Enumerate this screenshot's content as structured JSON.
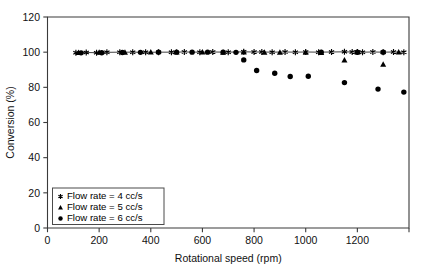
{
  "chart_data": {
    "type": "scatter",
    "title": "",
    "xlabel": "Rotational speed (rpm)",
    "ylabel": "Conversion (%)",
    "xlim": [
      0,
      1400
    ],
    "ylim": [
      0,
      120
    ],
    "xticks": [
      0,
      200,
      400,
      600,
      800,
      1000,
      1200
    ],
    "xticks_minor": [
      1400
    ],
    "yticks": [
      0,
      20,
      40,
      60,
      80,
      100,
      120
    ],
    "grid": false,
    "legend_position": "lower left",
    "series": [
      {
        "name": "Flow rate  =  4 cc/s",
        "marker": "star",
        "color": "#000000",
        "points": [
          [
            110,
            99.6
          ],
          [
            150,
            99.8
          ],
          [
            190,
            99.7
          ],
          [
            230,
            99.9
          ],
          [
            280,
            100.0
          ],
          [
            330,
            100.0
          ],
          [
            380,
            99.9
          ],
          [
            430,
            100.0
          ],
          [
            480,
            100.0
          ],
          [
            530,
            100.1
          ],
          [
            590,
            100.0
          ],
          [
            640,
            100.1
          ],
          [
            700,
            100.0
          ],
          [
            760,
            100.2
          ],
          [
            800,
            100.1
          ],
          [
            830,
            100.1
          ],
          [
            870,
            100.0
          ],
          [
            920,
            100.1
          ],
          [
            960,
            100.0
          ],
          [
            1000,
            100.1
          ],
          [
            1050,
            100.0
          ],
          [
            1100,
            100.1
          ],
          [
            1150,
            100.2
          ],
          [
            1180,
            100.1
          ],
          [
            1200,
            100.1
          ],
          [
            1220,
            100.0
          ],
          [
            1260,
            100.1
          ],
          [
            1300,
            100.0
          ],
          [
            1340,
            100.1
          ],
          [
            1380,
            100.0
          ]
        ]
      },
      {
        "name": "Flow rate  =  5 cc/s",
        "marker": "triangle",
        "color": "#000000",
        "points": [
          [
            120,
            99.7
          ],
          [
            200,
            99.8
          ],
          [
            300,
            99.9
          ],
          [
            400,
            100.0
          ],
          [
            500,
            100.0
          ],
          [
            600,
            100.0
          ],
          [
            680,
            99.9
          ],
          [
            760,
            100.0
          ],
          [
            840,
            99.9
          ],
          [
            900,
            99.8
          ],
          [
            1000,
            99.9
          ],
          [
            1060,
            99.7
          ],
          [
            1150,
            95.5
          ],
          [
            1200,
            100.0
          ],
          [
            1300,
            93.0
          ],
          [
            1360,
            100.0
          ]
        ]
      },
      {
        "name": "Flow rate  =  6 cc/s",
        "marker": "circle",
        "color": "#000000",
        "points": [
          [
            130,
            99.6
          ],
          [
            210,
            99.7
          ],
          [
            290,
            99.8
          ],
          [
            360,
            99.9
          ],
          [
            430,
            100.0
          ],
          [
            500,
            100.0
          ],
          [
            560,
            100.0
          ],
          [
            620,
            100.0
          ],
          [
            680,
            100.0
          ],
          [
            730,
            99.9
          ],
          [
            760,
            95.6
          ],
          [
            810,
            89.6
          ],
          [
            880,
            88.0
          ],
          [
            940,
            86.2
          ],
          [
            1010,
            86.3
          ],
          [
            1060,
            100.0
          ],
          [
            1150,
            82.7
          ],
          [
            1200,
            100.0
          ],
          [
            1280,
            79.0
          ],
          [
            1300,
            100.0
          ],
          [
            1380,
            77.3
          ]
        ]
      }
    ]
  },
  "legend": {
    "items": [
      {
        "marker": "star",
        "label": "Flow rate  =  4 cc/s"
      },
      {
        "marker": "triangle",
        "label": "Flow rate  =  5 cc/s"
      },
      {
        "marker": "circle",
        "label": "Flow rate  =  6 cc/s"
      }
    ]
  }
}
